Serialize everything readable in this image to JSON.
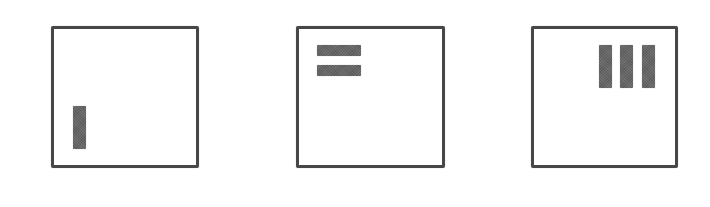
{
  "diagram": {
    "colors": {
      "background": "#ffffff",
      "border": "#474747",
      "block": "#666666"
    },
    "panels": [
      {
        "name": "panel-1",
        "x": 51,
        "y": 26,
        "width": 148,
        "height": 142,
        "blocks": [
          {
            "orientation": "vertical",
            "x": 73,
            "y": 106,
            "width": 13,
            "height": 43
          }
        ]
      },
      {
        "name": "panel-2",
        "x": 296,
        "y": 26,
        "width": 149,
        "height": 142,
        "blocks": [
          {
            "orientation": "horizontal",
            "x": 317,
            "y": 45,
            "width": 44,
            "height": 11
          },
          {
            "orientation": "horizontal",
            "x": 317,
            "y": 65,
            "width": 44,
            "height": 11
          }
        ]
      },
      {
        "name": "panel-3",
        "x": 531,
        "y": 26,
        "width": 147,
        "height": 142,
        "blocks": [
          {
            "orientation": "vertical",
            "x": 599,
            "y": 45,
            "width": 13,
            "height": 43
          },
          {
            "orientation": "vertical",
            "x": 620,
            "y": 45,
            "width": 13,
            "height": 43
          },
          {
            "orientation": "vertical",
            "x": 642,
            "y": 45,
            "width": 13,
            "height": 43
          }
        ]
      }
    ]
  }
}
